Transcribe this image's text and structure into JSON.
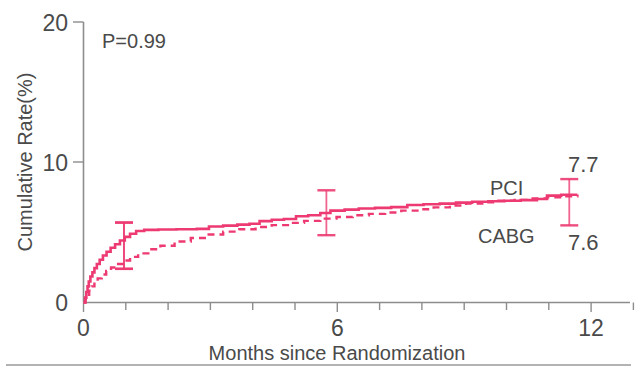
{
  "chart_data": {
    "type": "line",
    "title": "",
    "xlabel": "Months since Randomization",
    "ylabel": "Cumulative Rate(%)",
    "xlim": [
      0,
      13.5
    ],
    "ylim": [
      0,
      20
    ],
    "xticks": [
      0,
      1,
      2,
      3,
      4,
      5,
      6,
      7,
      8,
      9,
      10,
      11,
      12,
      13
    ],
    "xtick_labels": [
      "0",
      "",
      "",
      "",
      "",
      "",
      "6",
      "",
      "",
      "",
      "",
      "",
      "12",
      ""
    ],
    "yticks": [
      0,
      10,
      20
    ],
    "ytick_labels": [
      "0",
      "10",
      "20"
    ],
    "grid": false,
    "legend_position": "inline-annotation",
    "annotations": [
      {
        "name": "p-value",
        "text": "P=0.99",
        "x": 0.45,
        "y": 18.0
      },
      {
        "name": "pci-series-label",
        "text": "PCI",
        "x": 9.6,
        "y": 9.2
      },
      {
        "name": "cabg-series-label",
        "text": "CABG",
        "x": 9.5,
        "y": 5.2
      },
      {
        "name": "pci-final-value",
        "text": "7.7",
        "x": 12.5,
        "y": 11.0
      },
      {
        "name": "cabg-final-value",
        "text": "7.6",
        "x": 12.5,
        "y": 4.0
      }
    ],
    "error_bars": [
      {
        "series": "PCI",
        "x": 1.0,
        "y": 5.2,
        "low": 2.4,
        "high": 5.7
      },
      {
        "series": "CABG",
        "x": 1.0,
        "y": 4.2,
        "low": 2.4,
        "high": 5.7
      },
      {
        "series": "PCI",
        "x": 6.0,
        "y": 6.6,
        "low": 4.8,
        "high": 8.0
      },
      {
        "series": "PCI",
        "x": 12.0,
        "y": 7.7,
        "low": 5.5,
        "high": 8.8
      }
    ],
    "series": [
      {
        "name": "PCI",
        "style": "solid",
        "color": "#ED3A72",
        "final_value": 7.7,
        "points": [
          [
            0.0,
            0.0
          ],
          [
            0.04,
            0.35
          ],
          [
            0.07,
            0.75
          ],
          [
            0.1,
            1.15
          ],
          [
            0.13,
            1.5
          ],
          [
            0.17,
            1.85
          ],
          [
            0.22,
            2.15
          ],
          [
            0.27,
            2.45
          ],
          [
            0.33,
            2.75
          ],
          [
            0.4,
            3.05
          ],
          [
            0.48,
            3.35
          ],
          [
            0.57,
            3.62
          ],
          [
            0.67,
            3.9
          ],
          [
            0.78,
            4.15
          ],
          [
            0.9,
            4.42
          ],
          [
            1.02,
            4.68
          ],
          [
            1.15,
            4.9
          ],
          [
            1.3,
            5.1
          ],
          [
            1.5,
            5.18
          ],
          [
            1.85,
            5.2
          ],
          [
            2.3,
            5.22
          ],
          [
            2.8,
            5.25
          ],
          [
            3.1,
            5.42
          ],
          [
            3.45,
            5.48
          ],
          [
            3.8,
            5.55
          ],
          [
            4.1,
            5.62
          ],
          [
            4.35,
            5.8
          ],
          [
            4.65,
            5.9
          ],
          [
            4.95,
            5.95
          ],
          [
            5.25,
            6.15
          ],
          [
            5.55,
            6.22
          ],
          [
            5.85,
            6.38
          ],
          [
            6.1,
            6.55
          ],
          [
            6.45,
            6.62
          ],
          [
            6.8,
            6.7
          ],
          [
            7.2,
            6.75
          ],
          [
            7.6,
            6.8
          ],
          [
            8.0,
            6.95
          ],
          [
            8.4,
            7.0
          ],
          [
            8.8,
            7.05
          ],
          [
            9.2,
            7.12
          ],
          [
            9.6,
            7.18
          ],
          [
            10.0,
            7.22
          ],
          [
            10.4,
            7.26
          ],
          [
            10.8,
            7.3
          ],
          [
            11.2,
            7.38
          ],
          [
            11.45,
            7.62
          ],
          [
            11.8,
            7.68
          ],
          [
            12.2,
            7.7
          ]
        ]
      },
      {
        "name": "CABG",
        "style": "dashed",
        "color": "#ED3A72",
        "final_value": 7.6,
        "points": [
          [
            0.0,
            0.0
          ],
          [
            0.05,
            0.25
          ],
          [
            0.09,
            0.55
          ],
          [
            0.14,
            0.85
          ],
          [
            0.2,
            1.15
          ],
          [
            0.27,
            1.45
          ],
          [
            0.35,
            1.72
          ],
          [
            0.45,
            2.0
          ],
          [
            0.56,
            2.25
          ],
          [
            0.68,
            2.5
          ],
          [
            0.82,
            2.75
          ],
          [
            0.98,
            3.0
          ],
          [
            1.15,
            3.25
          ],
          [
            1.35,
            3.5
          ],
          [
            1.6,
            3.8
          ],
          [
            1.9,
            4.05
          ],
          [
            2.25,
            4.35
          ],
          [
            2.65,
            4.6
          ],
          [
            3.05,
            4.85
          ],
          [
            3.45,
            5.05
          ],
          [
            3.85,
            5.22
          ],
          [
            4.25,
            5.38
          ],
          [
            4.65,
            5.52
          ],
          [
            5.05,
            5.68
          ],
          [
            5.45,
            5.82
          ],
          [
            5.85,
            5.98
          ],
          [
            6.25,
            6.1
          ],
          [
            6.65,
            6.22
          ],
          [
            7.05,
            6.32
          ],
          [
            7.45,
            6.42
          ],
          [
            7.85,
            6.55
          ],
          [
            8.25,
            6.65
          ],
          [
            8.65,
            6.78
          ],
          [
            9.05,
            6.92
          ],
          [
            9.45,
            7.05
          ],
          [
            9.85,
            7.15
          ],
          [
            10.25,
            7.25
          ],
          [
            10.65,
            7.32
          ],
          [
            11.05,
            7.42
          ],
          [
            11.45,
            7.5
          ],
          [
            11.85,
            7.58
          ],
          [
            12.2,
            7.6
          ]
        ]
      }
    ]
  },
  "axes": {
    "y_axis_label": "Cumulative Rate(%)",
    "x_axis_label": "Months since Randomization",
    "y_tick_0": "0",
    "y_tick_10": "10",
    "y_tick_20": "20",
    "x_tick_0": "0",
    "x_tick_6": "6",
    "x_tick_12": "12"
  },
  "labels": {
    "p_value": "P=0.99",
    "pci": "PCI",
    "cabg": "CABG",
    "pci_value": "7.7",
    "cabg_value": "7.6"
  },
  "colors": {
    "curve": "#ED3A72",
    "axis": "#8d8d8d",
    "text": "#4a4a4a",
    "background": "#ffffff"
  }
}
